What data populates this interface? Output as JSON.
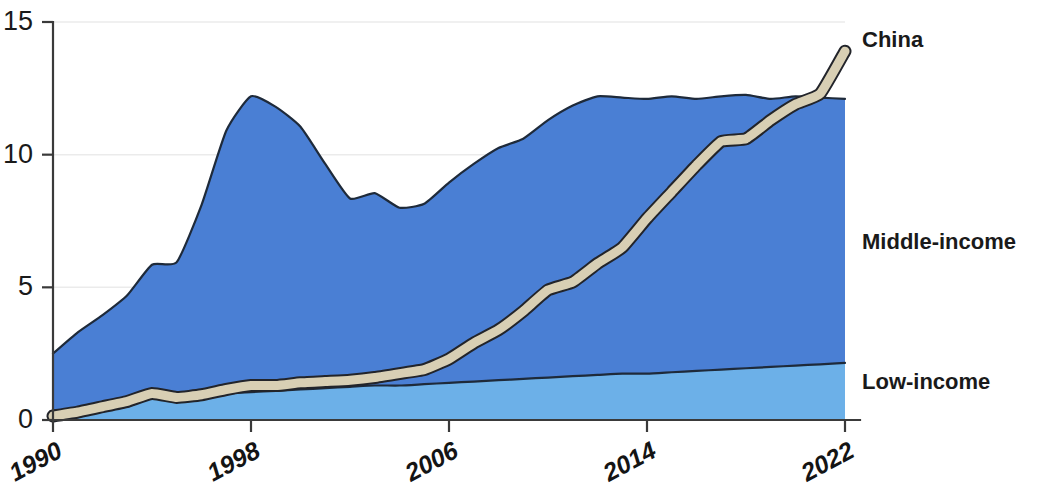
{
  "chart_data": {
    "type": "area",
    "title": "",
    "subtitle": "",
    "xlabel": "",
    "ylabel": "",
    "stacked": true,
    "grid": true,
    "legend_position": "right-inline",
    "xlim": [
      1990,
      2022
    ],
    "ylim": [
      0,
      15
    ],
    "x": [
      1990,
      1991,
      1992,
      1993,
      1994,
      1995,
      1996,
      1997,
      1998,
      1999,
      2000,
      2001,
      2002,
      2003,
      2004,
      2005,
      2006,
      2007,
      2008,
      2009,
      2010,
      2011,
      2012,
      2013,
      2014,
      2015,
      2016,
      2017,
      2018,
      2019,
      2020,
      2021,
      2022
    ],
    "x_ticks": [
      1990,
      1998,
      2006,
      2014,
      2022
    ],
    "x_tick_labels": [
      "1990",
      "1998",
      "2006",
      "2014",
      "2022"
    ],
    "y_ticks": [
      0,
      5,
      10,
      15
    ],
    "y_tick_labels": [
      "0",
      "5",
      "10",
      "15"
    ],
    "series": [
      {
        "name": "Low-income",
        "color": "#6cb0e8",
        "values": [
          0.35,
          0.4,
          0.45,
          0.5,
          0.85,
          0.85,
          0.9,
          1.0,
          1.05,
          1.1,
          1.15,
          1.2,
          1.25,
          1.3,
          1.3,
          1.35,
          1.4,
          1.45,
          1.5,
          1.55,
          1.6,
          1.65,
          1.7,
          1.75,
          1.75,
          1.8,
          1.85,
          1.9,
          1.95,
          2.0,
          2.05,
          2.1,
          2.15
        ]
      },
      {
        "name": "Middle-income",
        "color": "#4a7fd4",
        "values": [
          2.15,
          2.9,
          3.5,
          4.2,
          5.0,
          5.1,
          7.2,
          9.9,
          11.15,
          10.7,
          9.9,
          8.45,
          7.1,
          7.25,
          6.7,
          6.8,
          7.55,
          8.2,
          8.75,
          9.05,
          9.7,
          10.2,
          10.5,
          10.4,
          10.35,
          10.4,
          10.25,
          10.3,
          10.3,
          10.1,
          10.15,
          10.05,
          9.95
        ]
      }
    ],
    "overlay_line": {
      "name": "China",
      "color": "#d8cfb4",
      "outline_color": "#22242a",
      "values": [
        0.15,
        0.3,
        0.5,
        0.7,
        1.0,
        0.85,
        0.95,
        1.15,
        1.3,
        1.3,
        1.4,
        1.45,
        1.5,
        1.6,
        1.75,
        1.9,
        2.3,
        2.9,
        3.4,
        4.1,
        4.9,
        5.2,
        5.9,
        6.5,
        7.6,
        8.6,
        9.6,
        10.5,
        10.6,
        11.3,
        11.9,
        12.3,
        13.9
      ]
    },
    "series_totals": {
      "note": "Stacked totals = Low-income + Middle-income",
      "values": [
        2.5,
        3.3,
        3.95,
        4.7,
        5.85,
        5.95,
        8.1,
        10.9,
        12.2,
        11.8,
        11.05,
        9.65,
        8.35,
        8.55,
        8.0,
        8.15,
        8.95,
        9.65,
        10.25,
        10.6,
        11.3,
        11.85,
        12.2,
        12.15,
        12.1,
        12.2,
        12.1,
        12.2,
        12.25,
        12.1,
        12.2,
        12.15,
        12.1
      ]
    }
  },
  "labels": {
    "china": "China",
    "middle_income": "Middle-income",
    "low_income": "Low-income"
  },
  "axis": {
    "y_labels": [
      "15",
      "10",
      "5",
      "0"
    ],
    "x_labels": [
      "1990",
      "1998",
      "2006",
      "2014",
      "2022"
    ]
  }
}
